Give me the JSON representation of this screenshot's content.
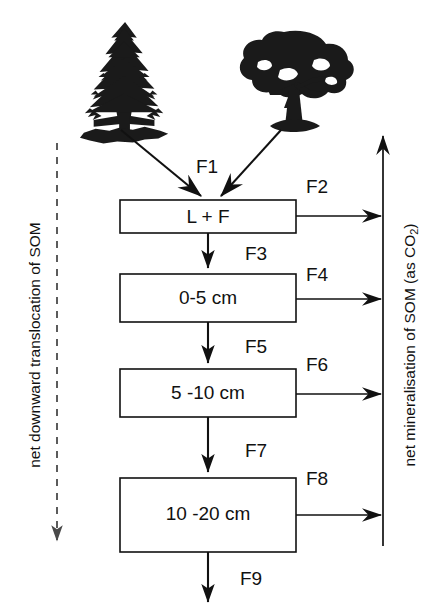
{
  "diagram": {
    "background_color": "#ffffff",
    "ink_color": "#111111",
    "dashed_color": "#4a4a4a",
    "width": 440,
    "height": 613
  },
  "sources": [
    {
      "name": "conifer-tree",
      "label": "coniferous tree"
    },
    {
      "name": "broadleaf-tree",
      "label": "broadleaved tree"
    }
  ],
  "pools": [
    {
      "id": "lf",
      "label": "L + F",
      "x": 120,
      "y": 200,
      "w": 176,
      "h": 33
    },
    {
      "id": "d0005",
      "label": "0-5 cm",
      "x": 120,
      "y": 274,
      "w": 176,
      "h": 48
    },
    {
      "id": "d0510",
      "label": "5 -10 cm",
      "x": 120,
      "y": 369,
      "w": 176,
      "h": 48
    },
    {
      "id": "d1020",
      "label": "10 -20 cm",
      "x": 120,
      "y": 478,
      "w": 176,
      "h": 74
    }
  ],
  "fluxes": [
    {
      "id": "F1",
      "label": "F1",
      "kind": "litterfall",
      "lx": 196,
      "ly": 168
    },
    {
      "id": "F2",
      "label": "F2",
      "kind": "mineralised",
      "lx": 306,
      "ly": 188
    },
    {
      "id": "F3",
      "label": "F3",
      "kind": "translocate",
      "lx": 245,
      "ly": 255
    },
    {
      "id": "F4",
      "label": "F4",
      "kind": "mineralised",
      "lx": 306,
      "ly": 276
    },
    {
      "id": "F5",
      "label": "F5",
      "kind": "translocate",
      "lx": 245,
      "ly": 348
    },
    {
      "id": "F6",
      "label": "F6",
      "kind": "mineralised",
      "lx": 306,
      "ly": 366
    },
    {
      "id": "F7",
      "label": "F7",
      "kind": "translocate",
      "lx": 245,
      "ly": 452
    },
    {
      "id": "F8",
      "label": "F8",
      "kind": "mineralised",
      "lx": 306,
      "ly": 480
    },
    {
      "id": "F9",
      "label": "F9",
      "kind": "leaching",
      "lx": 240,
      "ly": 580
    }
  ],
  "axes": {
    "left": {
      "name": "net-downward-translocation-axis",
      "label": "net downward translocation of SOM",
      "direction": "downward",
      "style": "dashed"
    },
    "right": {
      "name": "net-mineralisation-axis",
      "label_main": "net mineralisation of SOM (as CO",
      "label_sub": "2",
      "label_tail": ")",
      "direction": "upward",
      "style": "solid"
    }
  }
}
